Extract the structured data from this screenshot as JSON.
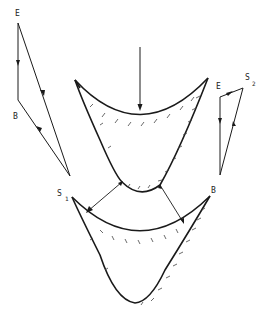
{
  "diagram": {
    "labels": {
      "left_polygon_top": "E",
      "left_polygon_bottom": "B",
      "right_polygon_e": "E",
      "right_polygon_s": "S",
      "right_polygon_s_sub": "2",
      "lower_left": "S",
      "lower_left_sub": "1",
      "lower_right": "B"
    },
    "colors": {
      "line": "#1a1a1a",
      "background": "#ffffff"
    }
  }
}
